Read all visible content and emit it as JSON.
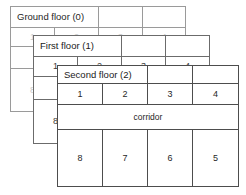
{
  "diagram": {
    "title_hidden": "",
    "colors": {
      "stroke_back": "#9a9a9a",
      "stroke_mid": "#6b6b6b",
      "stroke_front": "#4d4d4d",
      "text_faded": "#c9c9c9",
      "text_mid": "#3a3a3a",
      "text_front": "#262626",
      "background": "#ffffff"
    },
    "floors": [
      {
        "id": "ground-floor",
        "label": "Ground floor (0)",
        "depth": 0,
        "top_rooms": [
          "1",
          "2",
          "3",
          "4"
        ],
        "corridor_label": "",
        "bottom_rooms": [
          "8",
          "",
          "",
          ""
        ],
        "side_room": "8"
      },
      {
        "id": "first-floor",
        "label": "First floor (1)",
        "depth": 1,
        "top_rooms": [
          "1",
          "2",
          "3",
          "4"
        ],
        "corridor_label": "",
        "bottom_rooms": [
          "8",
          "",
          "",
          ""
        ],
        "side_room": "8"
      },
      {
        "id": "second-floor",
        "label": "Second floor (2)",
        "depth": 2,
        "top_rooms": [
          "1",
          "2",
          "3",
          "4"
        ],
        "corridor_label": "corridor",
        "bottom_rooms": [
          "8",
          "7",
          "6",
          "5"
        ],
        "side_room": ""
      }
    ]
  }
}
